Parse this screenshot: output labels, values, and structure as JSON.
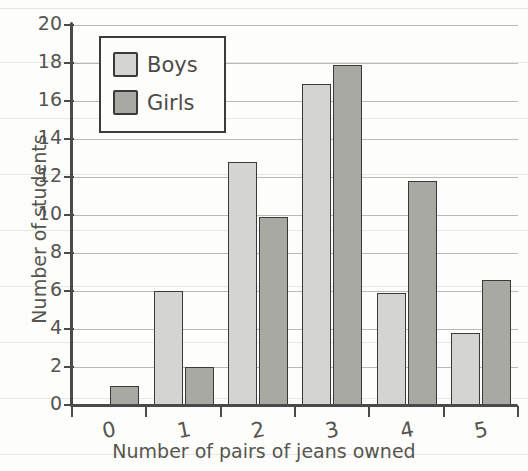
{
  "chart_data": {
    "type": "bar",
    "title": "",
    "xlabel": "Number of pairs of jeans owned",
    "ylabel": "Number of students",
    "categories": [
      "0",
      "1",
      "2",
      "3",
      "4",
      "5"
    ],
    "series": [
      {
        "name": "Boys",
        "color": "#d4d4d0",
        "values": [
          0,
          6,
          12.8,
          16.9,
          5.9,
          3.8
        ]
      },
      {
        "name": "Girls",
        "color": "#a9a9a4",
        "values": [
          1,
          2,
          9.9,
          17.9,
          11.8,
          6.6
        ]
      }
    ],
    "ylim": [
      0,
      20
    ],
    "ytick_labels": [
      "0",
      "2",
      "4",
      "6",
      "8",
      "10",
      "12",
      "14",
      "16",
      "18",
      "20"
    ],
    "ytick_values": [
      0,
      2,
      4,
      6,
      8,
      10,
      12,
      14,
      16,
      18,
      20
    ],
    "grid": true,
    "legend_position": "upper left",
    "style": "hand-drawn sketch on ruled paper"
  }
}
